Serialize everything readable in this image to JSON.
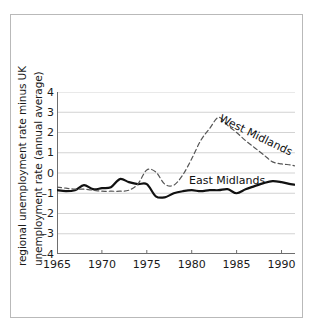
{
  "figure": {
    "background_color": "#ffffff",
    "frame_color": "#b9b9b9",
    "grid_color": "#c8c8c8",
    "axis_color": "#6e6e6e"
  },
  "chart_data": {
    "type": "line",
    "title": "",
    "subtitle": "",
    "xlabel": "",
    "ylabel": "regional unemployment rate minus UK unemployment rate (annual average)",
    "ylabel_lines": [
      "regional unemployment rate minus UK",
      "unemployment rate (annual average)"
    ],
    "xlim": [
      1965,
      1991.5
    ],
    "ylim": [
      -4,
      4
    ],
    "xticks": [
      1965,
      1970,
      1975,
      1980,
      1985,
      1990
    ],
    "xtick_labels": [
      "1965",
      "1970",
      "1975",
      "1980",
      "1985",
      "1990"
    ],
    "yticks": [
      4,
      3,
      2,
      1,
      0,
      -1,
      -2,
      -3,
      -4
    ],
    "ytick_labels": [
      "4",
      "3",
      "2",
      "1",
      "0",
      "–1",
      "–2",
      "–3",
      "–4"
    ],
    "grid": true,
    "grid_axis": "y",
    "legend": "inline-annotations",
    "annotations": [
      {
        "text": "West Midlands",
        "series": "West Midlands",
        "rotation": 26
      },
      {
        "text": "East Midlands",
        "series": "East Midlands",
        "rotation": 0
      }
    ],
    "x": [
      1965,
      1966,
      1967,
      1968,
      1969,
      1970,
      1971,
      1972,
      1973,
      1974,
      1975,
      1976,
      1977,
      1978,
      1979,
      1980,
      1981,
      1982,
      1983,
      1984,
      1985,
      1986,
      1987,
      1988,
      1989,
      1990,
      1991,
      1991.5
    ],
    "series": [
      {
        "name": "East Midlands",
        "style": "solid",
        "color": "#111111",
        "width": 2.2,
        "values": [
          -0.85,
          -0.9,
          -0.85,
          -0.6,
          -0.8,
          -0.75,
          -0.7,
          -0.3,
          -0.45,
          -0.55,
          -0.55,
          -1.15,
          -1.2,
          -1.0,
          -0.9,
          -0.85,
          -0.9,
          -0.85,
          -0.85,
          -0.8,
          -1.0,
          -0.8,
          -0.65,
          -0.5,
          -0.4,
          -0.45,
          -0.55,
          -0.58
        ]
      },
      {
        "name": "West Midlands",
        "style": "dashed",
        "color": "#555555",
        "width": 1.2,
        "values": [
          -0.7,
          -0.75,
          -0.8,
          -0.8,
          -0.85,
          -0.9,
          -0.9,
          -0.9,
          -0.85,
          -0.55,
          0.15,
          0.05,
          -0.55,
          -0.6,
          -0.1,
          0.7,
          1.6,
          2.2,
          2.75,
          2.35,
          2.0,
          1.6,
          1.25,
          0.9,
          0.55,
          0.45,
          0.4,
          0.35
        ]
      }
    ]
  }
}
